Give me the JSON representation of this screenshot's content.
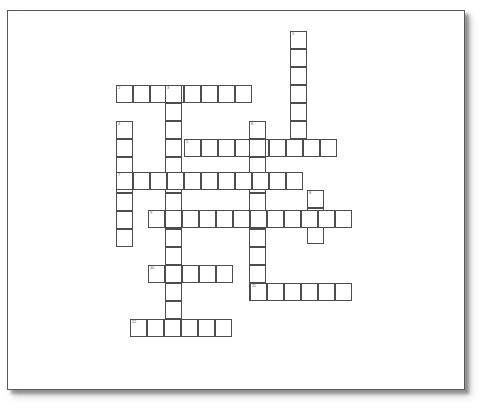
{
  "document": {
    "kind": "crossword-puzzle-worksheet",
    "background_color": "#ffffff",
    "paper_color": "#ffffff",
    "paper_border_color": "#58585a",
    "grid_line_color": "#4d4d4f",
    "number_color": "#5a5a5c"
  },
  "paper": {
    "x": 7,
    "y": 10,
    "width": 458,
    "height": 380
  },
  "crossword": {
    "cell_width": 17,
    "cell_height": 18,
    "entry_count": 12,
    "entries": [
      {
        "number": "1",
        "direction": "down",
        "x": 290,
        "y": 31,
        "length": 7
      },
      {
        "number": "2",
        "direction": "across",
        "x": 116,
        "y": 85,
        "length": 8
      },
      {
        "number": "3",
        "direction": "down",
        "x": 165,
        "y": 85,
        "length": 14
      },
      {
        "number": "4",
        "direction": "down",
        "x": 116,
        "y": 121,
        "length": 7
      },
      {
        "number": "5",
        "direction": "across",
        "x": 184,
        "y": 139,
        "length": 9
      },
      {
        "number": "6",
        "direction": "down",
        "x": 249,
        "y": 121,
        "length": 10
      },
      {
        "number": "7",
        "direction": "across",
        "x": 116,
        "y": 172,
        "length": 11
      },
      {
        "number": "8",
        "direction": "down",
        "x": 307,
        "y": 190,
        "length": 3
      },
      {
        "number": "9",
        "direction": "across",
        "x": 148,
        "y": 210,
        "length": 12
      },
      {
        "number": "10",
        "direction": "across",
        "x": 148,
        "y": 265,
        "length": 5
      },
      {
        "number": "11",
        "direction": "across",
        "x": 250,
        "y": 283,
        "length": 6
      },
      {
        "number": "12",
        "direction": "across",
        "x": 130,
        "y": 319,
        "length": 6
      }
    ]
  }
}
